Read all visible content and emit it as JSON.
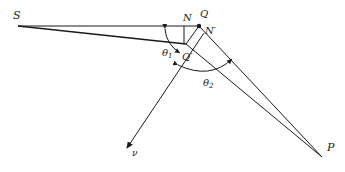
{
  "diagram": {
    "type": "geometry-refraction",
    "points": {
      "S": {
        "label": "S",
        "x": 18,
        "y": 26
      },
      "N": {
        "label": "N",
        "x": 184,
        "y": 26
      },
      "Q": {
        "label": "Q",
        "x": 199,
        "y": 26
      },
      "N_prime": {
        "label": "N′",
        "x": 203,
        "y": 33
      },
      "Q_prime": {
        "label": "Q′",
        "x": 186,
        "y": 44
      },
      "P": {
        "label": "P",
        "x": 322,
        "y": 157
      },
      "nu": {
        "label": "ν",
        "x": 127,
        "y": 148
      }
    },
    "angles": {
      "theta1": {
        "label": "θ",
        "sub": "1"
      },
      "theta2": {
        "label": "θ",
        "sub": "2"
      }
    },
    "colors": {
      "line": "#1a1a1a",
      "text": "#222222"
    }
  }
}
